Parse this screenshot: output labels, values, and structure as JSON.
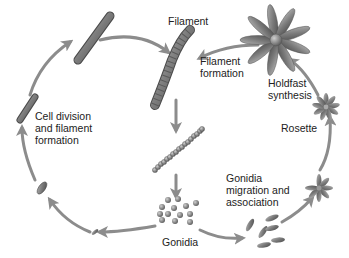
{
  "diagram": {
    "type": "life-cycle",
    "colors": {
      "arrow": "#8c8c8c",
      "cell": "#7a7a7a",
      "cell_dark": "#4a4a4a",
      "text": "#222222"
    },
    "labels": {
      "filament": "Filament",
      "filament_formation": "Filament\nformation",
      "holdfast_synthesis": "Holdfast\nsynthesis",
      "rosette": "Rosette",
      "gonidia_migration": "Gonidia\nmigration and\nassociation",
      "gonidia": "Gonidia",
      "cell_division": "Cell division\nand filament\nformation"
    },
    "stages": [
      {
        "id": "filament",
        "icon": "filament-icon"
      },
      {
        "id": "filament-chain",
        "icon": "chain-of-cells-icon"
      },
      {
        "id": "gonidia",
        "icon": "gonidia-cluster-icon"
      },
      {
        "id": "gonidia-migration",
        "icon": "scattered-gonidia-icon"
      },
      {
        "id": "small-rosette",
        "icon": "small-rosette-icon"
      },
      {
        "id": "rosette",
        "icon": "rosette-icon"
      },
      {
        "id": "holdfast",
        "icon": "large-rosette-holdfast-icon"
      },
      {
        "id": "single-cell",
        "icon": "single-cell-icon"
      },
      {
        "id": "short-cell",
        "icon": "short-cell-icon"
      },
      {
        "id": "elongating-cell",
        "icon": "elongating-cell-icon"
      },
      {
        "id": "short-filament",
        "icon": "short-filament-icon"
      }
    ]
  }
}
